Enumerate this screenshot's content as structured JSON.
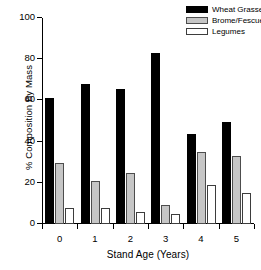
{
  "chart_data": {
    "type": "bar",
    "title": "",
    "xlabel": "Stand Age (Years)",
    "ylabel": "% Composition By Mass",
    "categories": [
      "0",
      "1",
      "2",
      "3",
      "4",
      "5"
    ],
    "ylim": [
      0,
      100
    ],
    "yticks": [
      0,
      20,
      40,
      60,
      80,
      100
    ],
    "ytick_labels": [
      "0",
      "20",
      "40",
      "60",
      "80",
      "100"
    ],
    "grid": false,
    "legend_position": "top-right",
    "series": [
      {
        "name": "Wheat Grasses",
        "color": "#000000",
        "values": [
          61,
          68,
          65.5,
          83,
          43.5,
          49.5
        ]
      },
      {
        "name": "Brome/Fescue",
        "color": "#c6c6c6",
        "values": [
          29.5,
          21,
          25,
          9,
          35,
          33
        ]
      },
      {
        "name": "Legumes",
        "color": "#ffffff",
        "values": [
          8,
          8,
          6,
          5,
          19,
          15
        ]
      }
    ]
  }
}
